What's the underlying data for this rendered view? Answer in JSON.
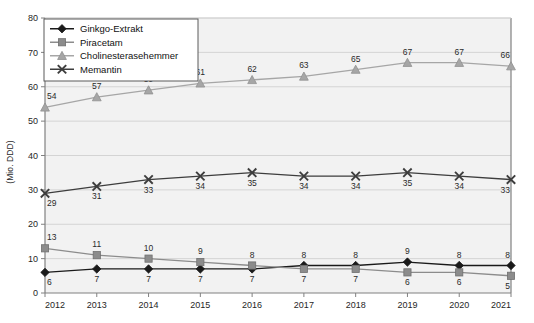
{
  "chart_data": {
    "type": "line",
    "title": "",
    "xlabel": "",
    "ylabel": "(Mio. DDD)",
    "ylim": [
      0,
      80
    ],
    "yticks": [
      0,
      10,
      20,
      30,
      40,
      50,
      60,
      70,
      80
    ],
    "grid": true,
    "legend_position": "top-left",
    "categories": [
      "2012",
      "2013",
      "2014",
      "2015",
      "2016",
      "2017",
      "2018",
      "2019",
      "2020",
      "2021"
    ],
    "series": [
      {
        "name": "Ginkgo-Extrakt",
        "marker": "diamond",
        "color": "#1a1a1a",
        "label_position": "below-then-above",
        "values": [
          6,
          7,
          7,
          7,
          7,
          8,
          8,
          9,
          8,
          8
        ]
      },
      {
        "name": "Piracetam",
        "marker": "square",
        "color": "#8c8c8c",
        "label_position": "above-then-below",
        "values": [
          13,
          11,
          10,
          9,
          8,
          7,
          7,
          6,
          6,
          5
        ]
      },
      {
        "name": "Cholinesterasehemmer",
        "marker": "triangle",
        "color": "#a6a6a6",
        "label_position": "above",
        "values": [
          54,
          57,
          59,
          61,
          62,
          63,
          65,
          67,
          67,
          66
        ]
      },
      {
        "name": "Memantin",
        "marker": "cross",
        "color": "#3d3d3d",
        "label_position": "below",
        "values": [
          29,
          31,
          33,
          34,
          35,
          34,
          34,
          35,
          34,
          33
        ]
      }
    ]
  },
  "legend": {
    "items": [
      {
        "label": "Ginkgo-Extrakt"
      },
      {
        "label": "Piracetam"
      },
      {
        "label": "Cholinesterasehemmer"
      },
      {
        "label": "Memantin"
      }
    ]
  },
  "axes": {
    "y_axis_title": "(Mio. DDD)",
    "y_tick_labels": [
      "0",
      "10",
      "20",
      "30",
      "40",
      "50",
      "60",
      "70",
      "80"
    ],
    "x_tick_labels": [
      "2012",
      "2013",
      "2014",
      "2015",
      "2016",
      "2017",
      "2018",
      "2019",
      "2020",
      "2021"
    ]
  },
  "style": {
    "plot_background": "#f2f2f2",
    "grid_color": "#d4d4d4",
    "axis_color": "#808080",
    "text_color": "#1f1f1f"
  }
}
